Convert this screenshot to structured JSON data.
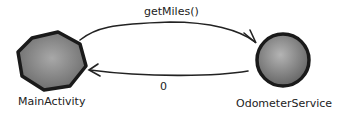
{
  "diagram": {
    "nodes": [
      {
        "id": "main",
        "label": "MainActivity",
        "shape": "hexagon"
      },
      {
        "id": "service",
        "label": "OdometerService",
        "shape": "circle"
      }
    ],
    "edges": [
      {
        "from": "main",
        "to": "service",
        "label": "getMiles()"
      },
      {
        "from": "service",
        "to": "main",
        "label": "0"
      }
    ]
  }
}
